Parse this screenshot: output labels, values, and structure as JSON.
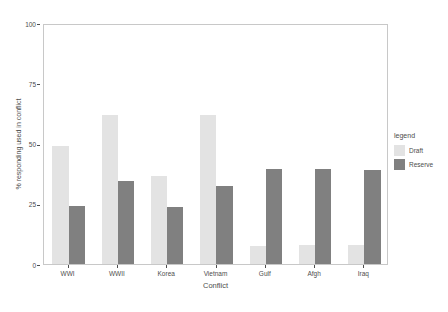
{
  "chart_data": {
    "type": "bar",
    "title": "",
    "subtitle": "",
    "xlabel": "Conflict",
    "ylabel": "% responding used in conflict",
    "categories": [
      "WWI",
      "WWII",
      "Korea",
      "Vietnam",
      "Gulf",
      "Afgh",
      "Iraq"
    ],
    "series": [
      {
        "name": "Draft",
        "values": [
          49,
          62,
          36.5,
          62,
          7.5,
          8,
          8
        ],
        "color": "#e3e3e3"
      },
      {
        "name": "Reserve",
        "values": [
          24,
          34.5,
          23.5,
          32.5,
          39.5,
          39.5,
          39
        ],
        "color": "#808080"
      }
    ],
    "ylim": [
      0,
      100
    ],
    "y_ticks": [
      0,
      25,
      50,
      75,
      100
    ],
    "y_tick_labels": [
      "0",
      "25",
      "50",
      "75",
      "100"
    ],
    "grid": false,
    "legend": {
      "title": "legend",
      "position": "right",
      "entries": [
        "Draft",
        "Reserve"
      ]
    },
    "bar_mode": "grouped",
    "annotations": []
  },
  "legend": {
    "title": "legend",
    "items": [
      {
        "label": "Draft",
        "color": "#e3e3e3",
        "key_name": "legend-key-draft"
      },
      {
        "label": "Reserve",
        "color": "#808080",
        "key_name": "legend-key-reserve"
      }
    ]
  },
  "axes": {
    "x_title": "Conflict",
    "y_title": "% responding used in conflict"
  },
  "colors": {
    "draft": "#e3e3e3",
    "reserve": "#808080",
    "panel_border": "#c8c8c8",
    "text": "#4d4d4d",
    "background": "#ffffff"
  }
}
